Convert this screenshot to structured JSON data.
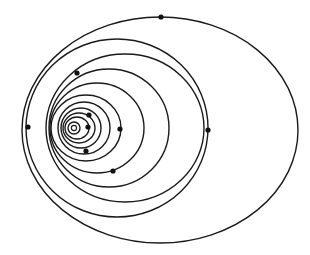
{
  "diagram": {
    "type": "nested-elliptical-orbits",
    "colors": {
      "background": "#ffffff",
      "stroke": "#1a1a1a",
      "dot": "#111111"
    },
    "focus": {
      "cx": 74,
      "cy": 128,
      "r": 2.6
    },
    "orbits": [
      {
        "cx": 74,
        "cy": 128,
        "rx": 6,
        "ry": 6
      },
      {
        "cx": 77,
        "cy": 128,
        "rx": 12,
        "ry": 11
      },
      {
        "cx": 79,
        "cy": 128,
        "rx": 16,
        "ry": 15
      },
      {
        "cx": 81,
        "cy": 128,
        "rx": 20,
        "ry": 20
      },
      {
        "cx": 84,
        "cy": 128,
        "rx": 26,
        "ry": 26
      },
      {
        "cx": 86,
        "cy": 128,
        "rx": 35,
        "ry": 33
      },
      {
        "cx": 97,
        "cy": 128,
        "rx": 47,
        "ry": 45
      },
      {
        "cx": 109,
        "cy": 128,
        "rx": 60,
        "ry": 59
      },
      {
        "cx": 125,
        "cy": 128,
        "rx": 79,
        "ry": 74
      },
      {
        "cx": 117,
        "cy": 128,
        "rx": 91,
        "ry": 89
      },
      {
        "cx": 160,
        "cy": 130,
        "rx": 138,
        "ry": 113
      }
    ],
    "bodies": [
      {
        "x": 88,
        "y": 127,
        "r": 2.6
      },
      {
        "x": 89,
        "y": 115,
        "r": 2.6
      },
      {
        "x": 86,
        "y": 151,
        "r": 2.6
      },
      {
        "x": 120,
        "y": 129,
        "r": 2.6
      },
      {
        "x": 113,
        "y": 171,
        "r": 2.6
      },
      {
        "x": 77,
        "y": 73,
        "r": 2.6
      },
      {
        "x": 28,
        "y": 127,
        "r": 2.6
      },
      {
        "x": 208,
        "y": 130,
        "r": 2.6
      },
      {
        "x": 161,
        "y": 17,
        "r": 2.6
      }
    ]
  }
}
